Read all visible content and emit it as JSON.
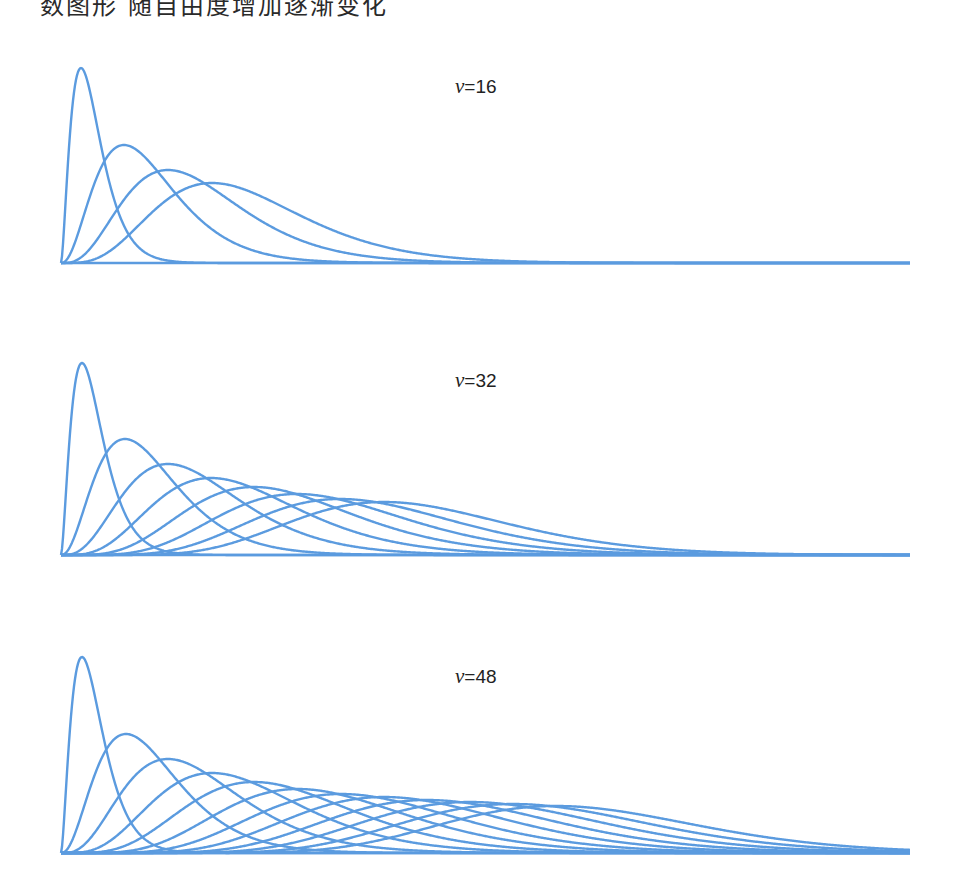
{
  "caption": "数图形 随自由度增加逐渐变化",
  "style": {
    "line_color": "#5b9bdf",
    "line_width": 2.4
  },
  "chart_data": [
    {
      "type": "line",
      "title": "v=16",
      "label": {
        "symbol": "ν",
        "text": "=16",
        "x": 455,
        "y": 92
      },
      "grid": false,
      "axes": {
        "x0": 61,
        "x1": 910,
        "baseline_y": 263
      },
      "n_curves": 4,
      "peaks": [
        {
          "x": 81,
          "y": 68
        },
        {
          "x": 124,
          "y": 145
        },
        {
          "x": 168,
          "y": 170
        },
        {
          "x": 212,
          "y": 183
        }
      ]
    },
    {
      "type": "line",
      "title": "v=32",
      "label": {
        "symbol": "ν",
        "text": "=32",
        "x": 455,
        "y": 386
      },
      "grid": false,
      "axes": {
        "x0": 61,
        "x1": 910,
        "baseline_y": 555
      },
      "n_curves": 8,
      "peaks": [
        {
          "x": 82,
          "y": 363
        },
        {
          "x": 125,
          "y": 439
        },
        {
          "x": 168,
          "y": 464
        },
        {
          "x": 211,
          "y": 478
        },
        {
          "x": 254,
          "y": 487
        },
        {
          "x": 297,
          "y": 494
        },
        {
          "x": 340,
          "y": 499
        },
        {
          "x": 384,
          "y": 502
        }
      ]
    },
    {
      "type": "line",
      "title": "v=48",
      "label": {
        "symbol": "ν",
        "text": "=48",
        "x": 455,
        "y": 682
      },
      "grid": false,
      "axes": {
        "x0": 61,
        "x1": 910,
        "baseline_y": 853
      },
      "n_curves": 12,
      "peaks": [
        {
          "x": 82,
          "y": 657
        },
        {
          "x": 126,
          "y": 734
        },
        {
          "x": 168,
          "y": 759
        },
        {
          "x": 212,
          "y": 773
        },
        {
          "x": 254,
          "y": 782
        },
        {
          "x": 298,
          "y": 789
        },
        {
          "x": 341,
          "y": 794
        },
        {
          "x": 384,
          "y": 797
        },
        {
          "x": 427,
          "y": 800
        },
        {
          "x": 470,
          "y": 802
        },
        {
          "x": 513,
          "y": 804
        },
        {
          "x": 556,
          "y": 806
        }
      ]
    }
  ]
}
